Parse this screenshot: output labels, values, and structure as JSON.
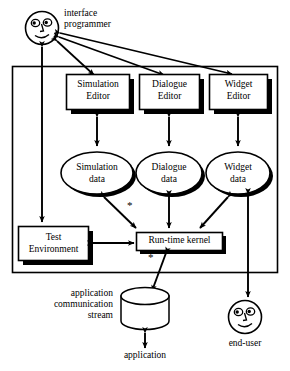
{
  "diagram": {
    "actors": [
      {
        "id": "interface-programmer",
        "label_line1": "interface",
        "label_line2": "programmer",
        "icon": "smiley-face-icon"
      },
      {
        "id": "end-user",
        "label": "end-user",
        "icon": "smiley-face-icon"
      }
    ],
    "editors": [
      {
        "id": "simulation-editor",
        "line1": "Simulation",
        "line2": "Editor"
      },
      {
        "id": "dialogue-editor",
        "line1": "Dialogue",
        "line2": "Editor"
      },
      {
        "id": "widget-editor",
        "line1": "Widget",
        "line2": "Editor"
      }
    ],
    "data_stores": [
      {
        "id": "simulation-data",
        "line1": "Simulation",
        "line2": "data"
      },
      {
        "id": "dialogue-data",
        "line1": "Dialogue",
        "line2": "data"
      },
      {
        "id": "widget-data",
        "line1": "Widget",
        "line2": "data"
      }
    ],
    "test_environment": {
      "line1": "Test",
      "line2": "Environment"
    },
    "runtime_kernel": {
      "label": "Run-time kernel"
    },
    "stream": {
      "line1": "application",
      "line2": "communication",
      "line3": "stream"
    },
    "application": {
      "label": "application"
    },
    "multiplicity_markers": [
      "*",
      "*",
      "*"
    ],
    "colors": {
      "stroke": "#000000",
      "fill": "#ffffff",
      "shadow": "#000000",
      "background": "#ffffff"
    }
  }
}
